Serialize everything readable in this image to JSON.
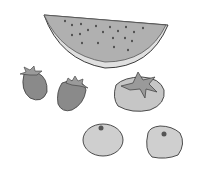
{
  "image": {
    "description": "Grayscale clip-art illustration of assorted fruits",
    "style": "grayscale line art",
    "background": "#ffffff",
    "items": [
      {
        "name": "watermelon slice",
        "count": 1
      },
      {
        "name": "strawberry",
        "count": 2
      },
      {
        "name": "persimmon",
        "count": 1
      },
      {
        "name": "mandarin orange",
        "count": 2
      }
    ],
    "colors": {
      "outline": "#3a3a3a",
      "watermelon_flesh": "#b0b0b0",
      "watermelon_rind": "#d8d8d8",
      "strawberry": "#8a8a8a",
      "leaf": "#9a9a9a",
      "persimmon": "#c6c6c6",
      "mandarin": "#cfcfcf",
      "seed": "#333333"
    }
  }
}
